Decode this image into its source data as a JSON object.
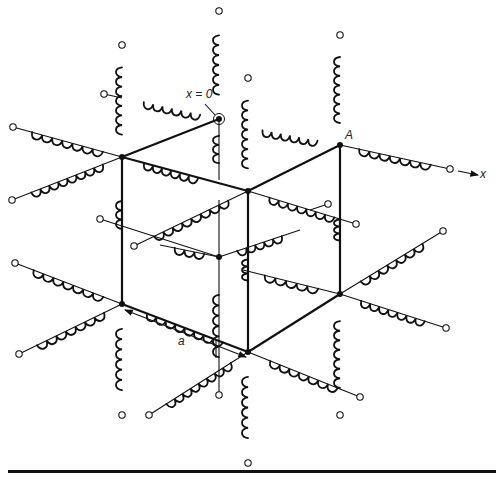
{
  "figure": {
    "labels": {
      "origin": "x = 0",
      "node_a": "A",
      "axis_x": "x",
      "spacing": "a"
    },
    "colors": {
      "ink": "#111111",
      "background": "#ffffff"
    },
    "nodes": [
      {
        "id": "N1",
        "x": 122,
        "y": 157
      },
      {
        "id": "N2",
        "x": 248,
        "y": 191
      },
      {
        "id": "A",
        "x": 340,
        "y": 145
      },
      {
        "id": "X0",
        "x": 219,
        "y": 119
      },
      {
        "id": "N5",
        "x": 122,
        "y": 304
      },
      {
        "id": "N6",
        "x": 248,
        "y": 352
      },
      {
        "id": "N7",
        "x": 340,
        "y": 294
      },
      {
        "id": "N8",
        "x": 219,
        "y": 257
      }
    ],
    "bonds": [
      [
        122,
        157,
        219,
        119
      ],
      [
        122,
        157,
        248,
        191
      ],
      [
        248,
        191,
        340,
        145
      ],
      [
        122,
        157,
        122,
        304
      ],
      [
        248,
        191,
        248,
        352
      ],
      [
        340,
        145,
        340,
        294
      ],
      [
        122,
        304,
        248,
        352
      ],
      [
        248,
        352,
        340,
        294
      ]
    ],
    "coils": [
      [
        122,
        45,
        122,
        157,
        0.6
      ],
      [
        219,
        11,
        219,
        119,
        0.55
      ],
      [
        340,
        35,
        340,
        145,
        0.6
      ],
      [
        248,
        78,
        248,
        191,
        0.6
      ],
      [
        219,
        119,
        219,
        180,
        0.45
      ],
      [
        122,
        304,
        122,
        415,
        0.55
      ],
      [
        248,
        352,
        248,
        463,
        0.55
      ],
      [
        340,
        294,
        340,
        415,
        0.55
      ],
      [
        219,
        257,
        219,
        395,
        0.45
      ],
      [
        122,
        180,
        122,
        250,
        0.4
      ],
      [
        340,
        200,
        340,
        260,
        0.35
      ],
      [
        248,
        240,
        248,
        300,
        0.35
      ],
      [
        13,
        127,
        122,
        157,
        0.65
      ],
      [
        12,
        200,
        122,
        157,
        0.65
      ],
      [
        125,
        98,
        219,
        119,
        0.6
      ],
      [
        219,
        119,
        340,
        145,
        0.0
      ],
      [
        240,
        126,
        340,
        145,
        0.55
      ],
      [
        340,
        145,
        450,
        169,
        0.65
      ],
      [
        248,
        191,
        328,
        204,
        0.0
      ],
      [
        248,
        191,
        356,
        224,
        0.6
      ],
      [
        134,
        246,
        248,
        191,
        0.65
      ],
      [
        248,
        191,
        340,
        145,
        0.0
      ],
      [
        122,
        157,
        219,
        119,
        0.0
      ],
      [
        15,
        263,
        122,
        304,
        0.65
      ],
      [
        19,
        354,
        122,
        304,
        0.65
      ],
      [
        122,
        304,
        248,
        352,
        0.6
      ],
      [
        149,
        415,
        248,
        352,
        0.65
      ],
      [
        248,
        352,
        360,
        397,
        0.6
      ],
      [
        340,
        294,
        443,
        231,
        0.6
      ],
      [
        340,
        294,
        446,
        328,
        0.6
      ],
      [
        248,
        352,
        340,
        294,
        0.0
      ],
      [
        219,
        257,
        248,
        240,
        0.0
      ],
      [
        160,
        245,
        219,
        257,
        0.5
      ],
      [
        219,
        257,
        122,
        304,
        0.0
      ],
      [
        219,
        257,
        300,
        230,
        0.55
      ],
      [
        243,
        270,
        340,
        294,
        0.55
      ],
      [
        122,
        157,
        220,
        185,
        0.55
      ]
    ],
    "wires": [
      [
        219,
        119,
        219,
        180
      ],
      [
        219,
        200,
        219,
        257
      ],
      [
        219,
        257,
        219,
        395
      ],
      [
        122,
        157,
        13,
        127
      ],
      [
        122,
        157,
        12,
        200
      ],
      [
        340,
        145,
        450,
        169
      ],
      [
        248,
        191,
        356,
        224
      ],
      [
        248,
        191,
        134,
        246
      ],
      [
        122,
        304,
        15,
        263
      ],
      [
        122,
        304,
        19,
        354
      ],
      [
        248,
        352,
        149,
        415
      ],
      [
        248,
        352,
        360,
        397
      ],
      [
        340,
        294,
        443,
        231
      ],
      [
        340,
        294,
        446,
        328
      ],
      [
        219,
        257,
        160,
        245
      ],
      [
        219,
        257,
        300,
        230
      ],
      [
        219,
        257,
        100,
        219
      ],
      [
        340,
        294,
        243,
        270
      ],
      [
        104,
        94,
        122,
        98
      ],
      [
        328,
        204,
        310,
        210
      ]
    ],
    "terminals": [
      [
        219,
        11
      ],
      [
        122,
        45
      ],
      [
        340,
        35
      ],
      [
        248,
        78
      ],
      [
        104,
        94
      ],
      [
        13,
        127
      ],
      [
        12,
        200
      ],
      [
        450,
        169
      ],
      [
        328,
        204
      ],
      [
        356,
        224
      ],
      [
        100,
        219
      ],
      [
        134,
        246
      ],
      [
        443,
        231
      ],
      [
        15,
        263
      ],
      [
        19,
        354
      ],
      [
        446,
        328
      ],
      [
        122,
        415
      ],
      [
        149,
        415
      ],
      [
        219,
        395
      ],
      [
        340,
        415
      ],
      [
        360,
        397
      ],
      [
        248,
        463
      ]
    ],
    "arrows": {
      "x_axis": [
        458,
        171,
        478,
        175
      ],
      "dimension": [
        125,
        310,
        246,
        357
      ]
    }
  }
}
